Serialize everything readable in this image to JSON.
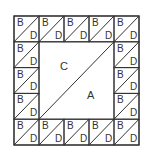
{
  "diagram": {
    "grid": {
      "rows": 5,
      "cols": 5,
      "x": 14,
      "y": 16,
      "width": 125,
      "height": 129
    },
    "border_cell": {
      "top_label": "B",
      "bottom_label": "D"
    },
    "center": {
      "upper_left_label": "C",
      "lower_right_label": "A"
    },
    "colors": {
      "line": "#333333",
      "background": "#ffffff"
    }
  }
}
